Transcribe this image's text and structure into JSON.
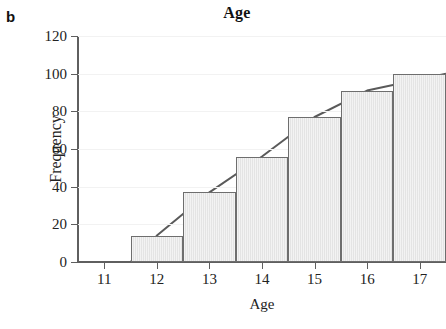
{
  "panel": {
    "letter": "b"
  },
  "chart_data": {
    "type": "bar",
    "title": "Age",
    "xlabel": "Age",
    "ylabel": "Frequency",
    "categories": [
      11,
      12,
      13,
      14,
      15,
      16,
      17
    ],
    "values": [
      0,
      14,
      37,
      56,
      77,
      91,
      100
    ],
    "series": [
      {
        "name": "Frequency",
        "values": [
          0,
          14,
          37,
          56,
          77,
          91,
          100
        ]
      },
      {
        "name": "Cumulative curve",
        "x": [
          11.5,
          12,
          13,
          14,
          15,
          16,
          17.5
        ],
        "values": [
          0,
          14,
          37,
          56,
          77,
          91,
          100
        ]
      }
    ],
    "xlim": [
      10.5,
      17.5
    ],
    "ylim": [
      0,
      120
    ],
    "ytick_labels": [
      "0",
      "20",
      "40",
      "60",
      "80",
      "100",
      "120"
    ],
    "yticks": [
      0,
      20,
      40,
      60,
      80,
      100,
      120
    ],
    "xtick_labels": [
      "11",
      "12",
      "13",
      "14",
      "15",
      "16",
      "17"
    ],
    "grid": "horizontal-faint",
    "legend": "none",
    "colors": {
      "bar_fill": "#e4e4e4",
      "bar_edge": "#6e6e6e",
      "axis": "#5f5f5f",
      "grid": "#f2f2f2",
      "line": "#5a5a5a",
      "text": "#1a1a1a"
    }
  }
}
